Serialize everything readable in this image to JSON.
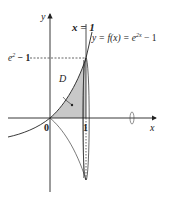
{
  "diagram": {
    "type": "math-figure",
    "labels": {
      "y_axis": "y",
      "x_axis": "x",
      "origin": "0",
      "x_tick_1": "1",
      "vertical_line": "x = 1",
      "curve": "y = f(x) = e",
      "curve_exponent": "2x",
      "curve_tail": " − 1",
      "y_level_base": "e",
      "y_level_exponent": "2",
      "y_level_tail": " − 1",
      "region": "D"
    },
    "colors": {
      "stroke": "#222222",
      "region_fill": "#c8c8c8",
      "background": "#ffffff"
    }
  }
}
